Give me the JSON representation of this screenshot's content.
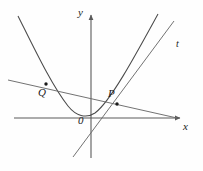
{
  "figure": {
    "type": "coordinate-geometry-diagram",
    "background_color": "#fefefe",
    "stroke_color": "#4a4a4a",
    "axis_color": "#5a5a5a",
    "label_color": "#1a1a1a",
    "axes": {
      "x_label": "x",
      "y_label": "y",
      "origin_label": "0",
      "x_axis": {
        "x1": 14,
        "y1": 118,
        "x2": 180,
        "y2": 118,
        "arrow": "right"
      },
      "y_axis": {
        "x1": 91,
        "y1": 158,
        "x2": 91,
        "y2": 15,
        "arrow": "up"
      }
    },
    "curves": [
      {
        "name": "parabola",
        "label": "",
        "path": "M 18,16 C 34,48 52,86 68,106 C 76,116 86,119 95,113 C 110,102 134,58 158,14"
      }
    ],
    "lines": [
      {
        "name": "secant-line-QP",
        "label": "",
        "x1": 8,
        "y1": 80,
        "x2": 177,
        "y2": 118
      },
      {
        "name": "tangent-line-t",
        "label": "t",
        "x1": 73,
        "y1": 157,
        "x2": 174,
        "y2": 21
      }
    ],
    "points": [
      {
        "name": "Q",
        "label": "Q",
        "cx": 46,
        "cy": 84,
        "r": 1.7
      },
      {
        "name": "P",
        "label": "P",
        "cx": 117,
        "cy": 104,
        "r": 1.7
      }
    ]
  }
}
